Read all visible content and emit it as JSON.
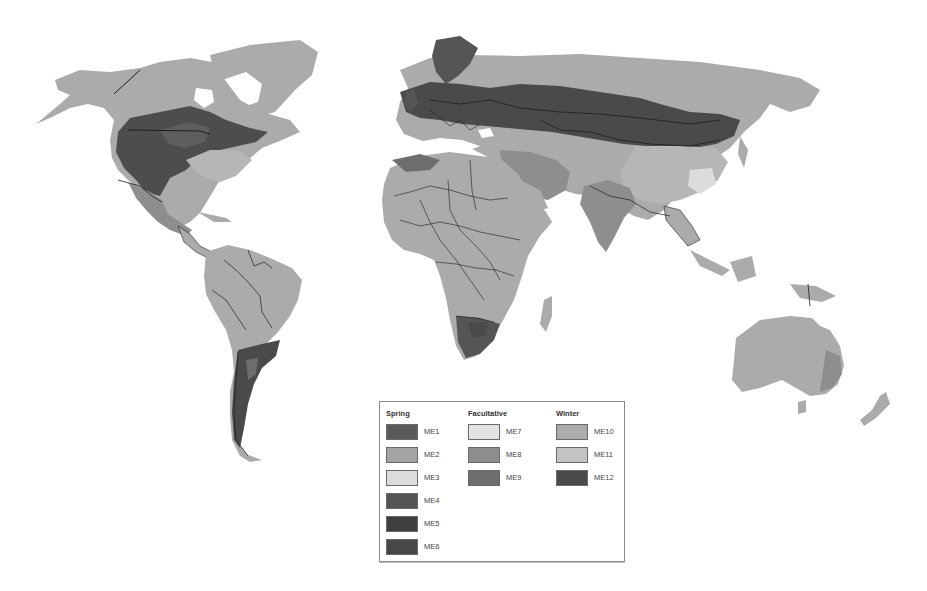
{
  "map": {
    "type": "world choropleth (grayscale)",
    "colors": {
      "ocean": "#ffffff",
      "border": "#1e1e1e",
      "ice": "#ffffff"
    },
    "region_fills": {
      "north_america_north": "ME10",
      "north_america_plains": "ME4",
      "north_america_southeast": "ME10",
      "mexico": "ME2",
      "south_america": "ME10",
      "southern_cone": "ME12",
      "africa": "ME10",
      "southern_africa": "ME4",
      "europe": "ME12",
      "russia_north": "ME10",
      "central_asia": "ME12",
      "china_south": "ME11",
      "india": "ME8",
      "southeast_asia": "ME10",
      "australia": "ME10"
    }
  },
  "legend": {
    "groups": [
      {
        "title": "Spring",
        "items": [
          {
            "label": "ME1",
            "color": "#5a5a5a"
          },
          {
            "label": "ME2",
            "color": "#a3a3a3"
          },
          {
            "label": "ME3",
            "color": "#dcdcdc"
          },
          {
            "label": "ME4",
            "color": "#555555"
          },
          {
            "label": "ME5",
            "color": "#3e3e3e"
          },
          {
            "label": "ME6",
            "color": "#474747"
          }
        ]
      },
      {
        "title": "Facultative",
        "items": [
          {
            "label": "ME7",
            "color": "#e2e2e2"
          },
          {
            "label": "ME8",
            "color": "#8e8e8e"
          },
          {
            "label": "ME9",
            "color": "#6e6e6e"
          }
        ]
      },
      {
        "title": "Winter",
        "items": [
          {
            "label": "ME10",
            "color": "#ababab"
          },
          {
            "label": "ME11",
            "color": "#c3c3c3"
          },
          {
            "label": "ME12",
            "color": "#4a4a4a"
          }
        ]
      }
    ]
  }
}
